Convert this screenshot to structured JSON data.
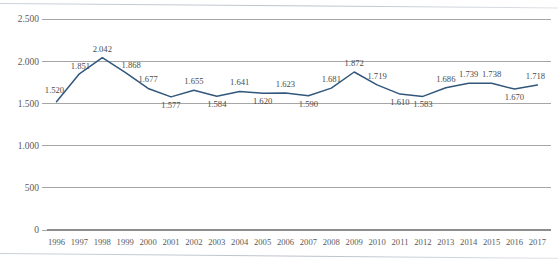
{
  "chart_data": {
    "type": "line",
    "title": "",
    "subtitle": "",
    "xlabel": "",
    "ylabel": "",
    "categories": [
      "1996",
      "1997",
      "1998",
      "1999",
      "2000",
      "2001",
      "2002",
      "2003",
      "2004",
      "2005",
      "2006",
      "2007",
      "2008",
      "2009",
      "2010",
      "2011",
      "2012",
      "2013",
      "2014",
      "2015",
      "2016",
      "2017"
    ],
    "values": [
      1520,
      1851,
      2042,
      1868,
      1677,
      1577,
      1655,
      1584,
      1641,
      1620,
      1623,
      1590,
      1681,
      1872,
      1719,
      1610,
      1583,
      1686,
      1739,
      1738,
      1670,
      1718
    ],
    "point_labels": [
      "1.520",
      "1.851",
      "2.042",
      "1.868",
      "1.677",
      "1.577",
      "1.655",
      "1.584",
      "1.641",
      "1.620",
      "1.623",
      "1.590",
      "1.681",
      "1.872",
      "1.719",
      "1.610",
      "1.583",
      "1.686",
      "1.739",
      "1.738",
      "1.670",
      "1.718"
    ],
    "series": [
      {
        "name": "",
        "values": [
          1520,
          1851,
          2042,
          1868,
          1677,
          1577,
          1655,
          1584,
          1641,
          1620,
          1623,
          1590,
          1681,
          1872,
          1719,
          1610,
          1583,
          1686,
          1739,
          1738,
          1670,
          1718
        ],
        "color": "#31577c"
      }
    ],
    "ylim": [
      0,
      2500
    ],
    "y_ticks": [
      0,
      500,
      1000,
      1500,
      2000,
      2500
    ],
    "y_tick_labels": [
      "0",
      "500",
      "1.000",
      "1.500",
      "2.000",
      "2.500"
    ],
    "grid": true,
    "grid_axis": "y",
    "legend": false,
    "legend_position": "none",
    "decimal_separator": ".",
    "show_data_labels": true,
    "line_color": "#31577c",
    "gridline_color": "#a6a6a6",
    "axis_color": "#8d8d8d",
    "background_color": "#ffffff",
    "text_color": "#5a5a5a"
  },
  "label_offsets": {
    "above": [
      0,
      1,
      2,
      3,
      4,
      6,
      8,
      10,
      12,
      13,
      14,
      17,
      18,
      19,
      21
    ],
    "below": [
      5,
      7,
      9,
      11,
      15,
      16,
      20
    ]
  }
}
